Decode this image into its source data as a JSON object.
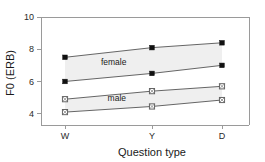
{
  "chart_data": {
    "type": "line",
    "title": "",
    "subtitle": "",
    "xlabel": "Question type",
    "ylabel": "F0 (ERB)",
    "categories": [
      "W",
      "Y",
      "D"
    ],
    "x": [
      0,
      1,
      2
    ],
    "ylim": [
      3.3,
      10.0
    ],
    "yticks": [
      4,
      6,
      8,
      10
    ],
    "ytick_labels": [
      "4",
      "6",
      "8",
      "10"
    ],
    "grid": false,
    "legend": "inline-annotations",
    "annotations": [
      {
        "text": "female",
        "x": 0.62,
        "y": 7.05
      },
      {
        "text": "male",
        "x": 0.66,
        "y": 4.78
      }
    ],
    "series": [
      {
        "name": "female-upper",
        "group": "female",
        "marker": "filled-square",
        "values": [
          7.5,
          8.1,
          8.4
        ]
      },
      {
        "name": "female-lower",
        "group": "female",
        "marker": "filled-square",
        "values": [
          6.0,
          6.5,
          7.0
        ]
      },
      {
        "name": "male-upper",
        "group": "male",
        "marker": "open-square",
        "values": [
          4.9,
          5.4,
          5.7
        ]
      },
      {
        "name": "male-lower",
        "group": "male",
        "marker": "open-square",
        "values": [
          4.1,
          4.45,
          4.85
        ]
      }
    ],
    "bands": [
      {
        "name": "female-band",
        "upper": "female-upper",
        "lower": "female-lower",
        "color": "#efefef"
      },
      {
        "name": "male-band",
        "upper": "male-upper",
        "lower": "male-lower",
        "color": "#efefef"
      }
    ],
    "colors": {
      "line": "#555555",
      "marker_filled": "#111111",
      "marker_open": "#ffffff",
      "band": "#efefef",
      "axis": "#9a9a9a"
    }
  }
}
